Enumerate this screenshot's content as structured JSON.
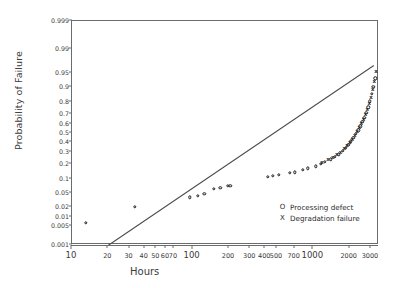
{
  "chart_data": {
    "type": "scatter",
    "title": "",
    "xlabel": "Hours",
    "ylabel": "Probability of Failure",
    "xscale": "log",
    "yscale": "probability",
    "xlim": [
      10,
      3500
    ],
    "ylim": [
      0.001,
      0.999
    ],
    "grid": false,
    "legend_position": "bottom-right",
    "xticks": [
      10,
      20,
      30,
      40,
      50,
      60,
      70,
      100,
      200,
      300,
      400,
      500,
      700,
      1000,
      2000,
      3000
    ],
    "xtick_labels": [
      "10",
      "20",
      "30",
      "40",
      "50",
      "60",
      "70",
      "100",
      "200",
      "300",
      "400",
      "500",
      "700",
      "1000",
      "2000",
      "3000"
    ],
    "xtick_major": [
      10,
      100,
      1000
    ],
    "yticks": [
      0.999,
      0.99,
      0.95,
      0.9,
      0.8,
      0.7,
      0.6,
      0.5,
      0.4,
      0.3,
      0.2,
      0.1,
      0.05,
      0.02,
      0.01,
      0.005,
      0.001
    ],
    "ytick_labels": [
      "0.999",
      "0.99",
      "0.95",
      "0.9",
      "0.8",
      "0.7",
      "0.6",
      "0.5",
      "0.4",
      "0.3",
      "0.2",
      "0.1",
      "0.05",
      "0.02",
      "0.01",
      "0.005",
      "0.001"
    ],
    "series": [
      {
        "name": "Processing defect",
        "marker": "O",
        "points": [
          [
            13,
            0.0065
          ],
          [
            33,
            0.021
          ],
          [
            95,
            0.038
          ],
          [
            110,
            0.042
          ],
          [
            125,
            0.046
          ],
          [
            150,
            0.062
          ],
          [
            170,
            0.065
          ],
          [
            195,
            0.072
          ],
          [
            205,
            0.073
          ],
          [
            420,
            0.115
          ],
          [
            460,
            0.12
          ],
          [
            520,
            0.125
          ],
          [
            640,
            0.135
          ],
          [
            700,
            0.14
          ],
          [
            820,
            0.155
          ],
          [
            900,
            0.165
          ],
          [
            1050,
            0.18
          ],
          [
            1150,
            0.2
          ],
          [
            1250,
            0.215
          ],
          [
            1400,
            0.235
          ],
          [
            1500,
            0.255
          ],
          [
            1620,
            0.28
          ],
          [
            1750,
            0.31
          ],
          [
            1850,
            0.34
          ],
          [
            1950,
            0.375
          ],
          [
            2050,
            0.41
          ],
          [
            2150,
            0.45
          ],
          [
            2250,
            0.49
          ],
          [
            2350,
            0.53
          ],
          [
            2450,
            0.575
          ],
          [
            2550,
            0.62
          ],
          [
            2650,
            0.665
          ],
          [
            2750,
            0.71
          ],
          [
            2850,
            0.76
          ],
          [
            2950,
            0.81
          ],
          [
            3050,
            0.86
          ],
          [
            3150,
            0.9
          ],
          [
            3250,
            0.935
          ]
        ]
      },
      {
        "name": "Degradation failure",
        "marker": "X",
        "points": [
          [
            1180,
            0.205
          ],
          [
            1320,
            0.225
          ],
          [
            1450,
            0.245
          ],
          [
            1560,
            0.268
          ],
          [
            1680,
            0.295
          ],
          [
            1800,
            0.325
          ],
          [
            1900,
            0.355
          ],
          [
            2000,
            0.39
          ],
          [
            2100,
            0.428
          ],
          [
            2200,
            0.468
          ],
          [
            2300,
            0.508
          ],
          [
            2400,
            0.552
          ],
          [
            2500,
            0.598
          ],
          [
            2600,
            0.642
          ],
          [
            2700,
            0.688
          ],
          [
            2800,
            0.735
          ],
          [
            2900,
            0.785
          ],
          [
            3000,
            0.835
          ],
          [
            3100,
            0.88
          ],
          [
            3200,
            0.92
          ],
          [
            3300,
            0.955
          ]
        ]
      }
    ],
    "fit_line": {
      "name": "fitted-distribution-line",
      "x_start": 20,
      "y_start": 0.001,
      "x_end": 3200,
      "y_end": 0.97
    }
  },
  "legend": {
    "items": [
      {
        "symbol": "O",
        "label": "Processing defect"
      },
      {
        "symbol": "X",
        "label": "Degradation failure"
      }
    ]
  }
}
